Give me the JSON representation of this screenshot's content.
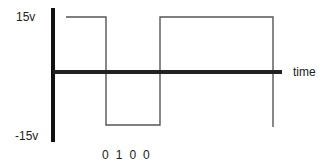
{
  "diagram": {
    "type": "square-wave",
    "y_axis": {
      "top_label": "15v",
      "bottom_label": "-15v"
    },
    "x_axis": {
      "label": "time"
    },
    "bit_labels": [
      "0",
      "1",
      "0",
      "0"
    ],
    "segments": [
      {
        "level": "high",
        "value": "15v"
      },
      {
        "level": "low",
        "value": "-15v"
      },
      {
        "level": "high",
        "value": "15v"
      }
    ],
    "colors": {
      "axis": "#111111",
      "waveform": "#555555",
      "text": "#222222"
    }
  }
}
